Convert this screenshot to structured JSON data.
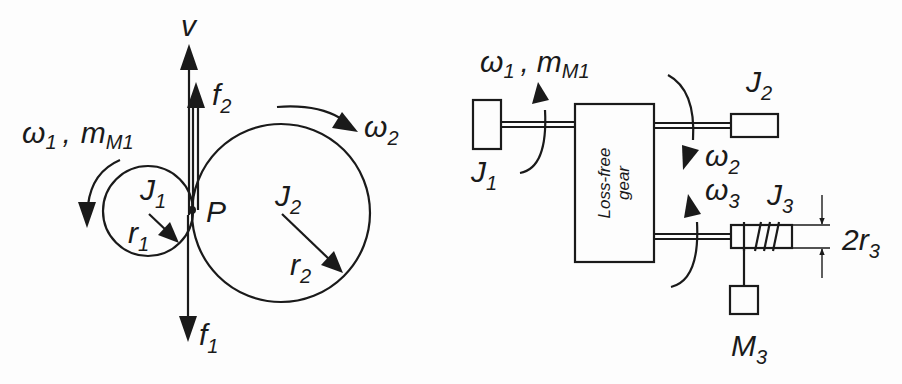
{
  "left_diagram": {
    "title": "Spur gear pair at contact point",
    "labels": {
      "velocity": {
        "main": "v"
      },
      "force_2": {
        "main": "f",
        "sub": "2"
      },
      "force_1": {
        "main": "f",
        "sub": "1"
      },
      "omega_1": {
        "main": "ω",
        "sub": "1"
      },
      "separator": ",",
      "torque_m1": {
        "main": "m",
        "sub": "M1"
      },
      "omega_2": {
        "main": "ω",
        "sub": "2"
      },
      "inertia_1": {
        "main": "J",
        "sub": "1"
      },
      "inertia_2": {
        "main": "J",
        "sub": "2"
      },
      "radius_1": {
        "main": "r",
        "sub": "1"
      },
      "radius_2": {
        "main": "r",
        "sub": "2"
      },
      "contact_point": {
        "main": "P"
      }
    }
  },
  "right_diagram": {
    "title": "Loss-free gear with drive and loads",
    "gear_box": {
      "line1": "Loss-free",
      "line2": "gear"
    },
    "labels": {
      "omega_1": {
        "main": "ω",
        "sub": "1"
      },
      "separator": ",",
      "torque_m1": {
        "main": "m",
        "sub": "M1"
      },
      "inertia_1": {
        "main": "J",
        "sub": "1"
      },
      "inertia_2": {
        "main": "J",
        "sub": "2"
      },
      "omega_2": {
        "main": "ω",
        "sub": "2"
      },
      "omega_3": {
        "main": "ω",
        "sub": "3"
      },
      "inertia_3": {
        "main": "J",
        "sub": "3"
      },
      "diameter": {
        "main": "2r",
        "sub": "3"
      },
      "mass_3": {
        "main": "M",
        "sub": "3"
      }
    }
  },
  "colors": {
    "ink": "#1a1a1a",
    "background": "#fdfdfd"
  }
}
